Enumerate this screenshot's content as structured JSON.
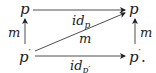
{
  "diagram": {
    "nodes": {
      "top_left": {
        "label": "p"
      },
      "top_right": {
        "label": "p"
      },
      "bottom_left": {
        "label": "p",
        "prime": "′"
      },
      "bottom_right": {
        "label": "p",
        "prime": "′",
        "suffix": "."
      }
    },
    "edges": {
      "top": {
        "label": "id",
        "sub": "p",
        "from": "top_left",
        "to": "top_right"
      },
      "bottom": {
        "label": "id",
        "sub": "p′",
        "from": "bottom_left",
        "to": "bottom_right"
      },
      "diagonal": {
        "label": "m",
        "from": "bottom_left",
        "to": "top_right"
      },
      "left": {
        "label": "m",
        "from": "bottom_left",
        "to": "top_left"
      },
      "right": {
        "label": "m",
        "from": "bottom_right",
        "to": "top_right"
      }
    },
    "colors": {
      "ink": "#222222",
      "background": "#ffffff"
    }
  }
}
